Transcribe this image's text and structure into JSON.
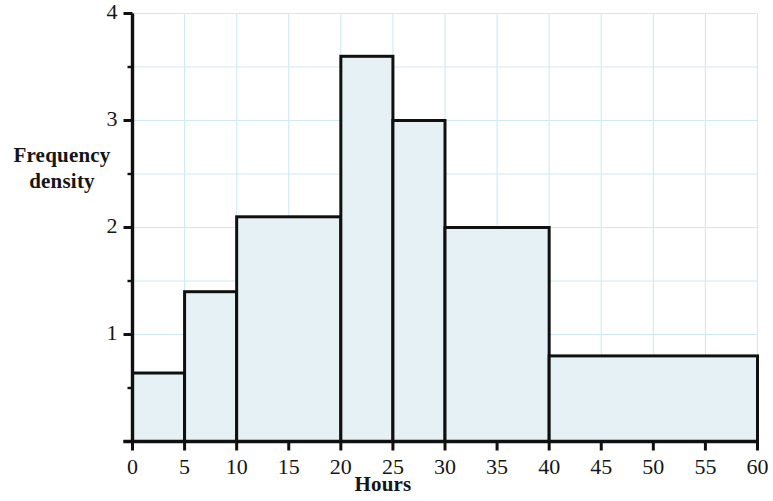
{
  "chart_data": {
    "type": "bar",
    "title": "",
    "subtitle": "",
    "xlabel": "Hours",
    "ylabel": "Frequency density",
    "ylabel_line1": "Frequency",
    "ylabel_line2": "density",
    "xlim": [
      0,
      60
    ],
    "ylim": [
      0,
      4
    ],
    "xticks": [
      0,
      5,
      10,
      15,
      20,
      25,
      30,
      35,
      40,
      45,
      50,
      55,
      60
    ],
    "xtick_labels": [
      "0",
      "5",
      "10",
      "15",
      "20",
      "25",
      "30",
      "35",
      "40",
      "45",
      "50",
      "55",
      "60"
    ],
    "yticks": [
      0,
      1,
      2,
      3,
      4
    ],
    "ytick_labels": [
      "1",
      "2",
      "3",
      "4"
    ],
    "ytick_labels_shown": [
      1,
      2,
      3,
      4
    ],
    "y_minor_ticks": [
      0.5,
      1.5,
      2.5,
      3.5
    ],
    "grid": true,
    "grid_color": "#cfeaf2",
    "legend": "none",
    "bar_fill": "#e6f1f5",
    "bar_edge": "#101010",
    "axis_color": "#101010",
    "bins": [
      {
        "start": 0,
        "end": 5,
        "value": 0.64,
        "label": "0-5"
      },
      {
        "start": 5,
        "end": 10,
        "value": 1.4,
        "label": "5-10"
      },
      {
        "start": 10,
        "end": 20,
        "value": 2.1,
        "label": "10-20"
      },
      {
        "start": 20,
        "end": 25,
        "value": 3.6,
        "label": "20-25"
      },
      {
        "start": 25,
        "end": 30,
        "value": 3.0,
        "label": "25-30"
      },
      {
        "start": 30,
        "end": 40,
        "value": 2.0,
        "label": "30-40"
      },
      {
        "start": 40,
        "end": 60,
        "value": 0.8,
        "label": "40-60"
      }
    ],
    "categories": [
      "0-5",
      "5-10",
      "10-20",
      "20-25",
      "25-30",
      "30-40",
      "40-60"
    ],
    "values": [
      0.64,
      1.4,
      2.1,
      3.6,
      3.0,
      2.0,
      0.8
    ]
  }
}
